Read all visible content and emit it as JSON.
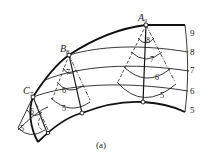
{
  "figure": {
    "caption": "(a)",
    "points": [
      {
        "id": "A",
        "label": "A",
        "subscript": "9"
      },
      {
        "id": "B",
        "label": "B",
        "subscript": "8"
      },
      {
        "id": "C",
        "label": "C",
        "subscript": "7"
      }
    ],
    "level_labels": [
      "9",
      "8",
      "7",
      "6",
      "5"
    ],
    "cone_A_labels": [
      "8",
      "7",
      "6",
      "5"
    ],
    "cone_B_labels": [
      "7",
      "6",
      "5"
    ],
    "cone_C_labels": [
      "6",
      "5"
    ]
  }
}
